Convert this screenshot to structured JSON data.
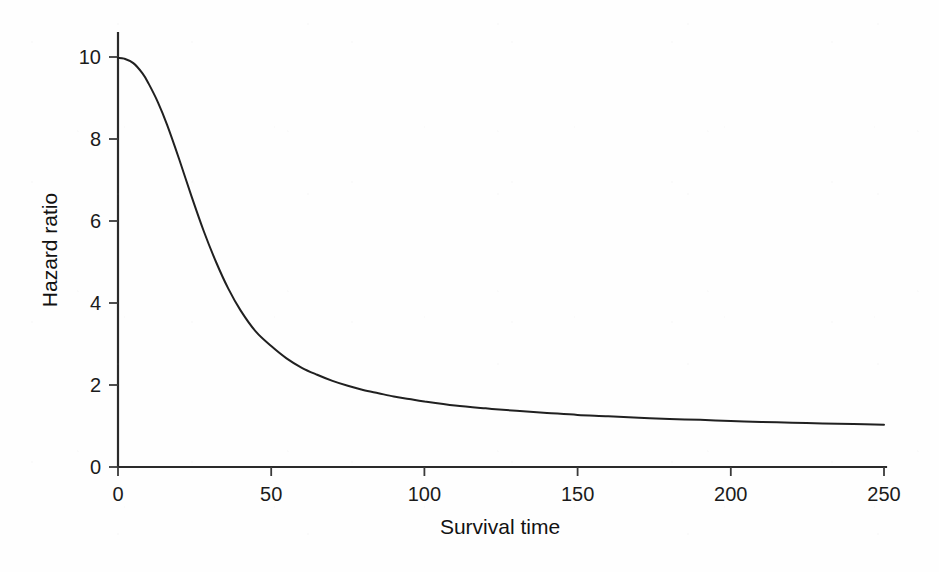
{
  "figure": {
    "background_color": "#fefefe",
    "ink_color": "#202020"
  },
  "chart_data": {
    "type": "line",
    "title": "",
    "subtitle": "",
    "xlabel": "Survival time",
    "ylabel": "Hazard ratio",
    "xlim": [
      0,
      250
    ],
    "ylim": [
      0,
      10
    ],
    "xticks": [
      0,
      50,
      100,
      150,
      200,
      250
    ],
    "yticks": [
      0,
      2,
      4,
      6,
      8,
      10
    ],
    "xtick_labels": [
      "0",
      "50",
      "100",
      "150",
      "200",
      "250"
    ],
    "ytick_labels": [
      "0",
      "2",
      "4",
      "6",
      "8",
      "10"
    ],
    "grid": false,
    "legend": false,
    "legend_position": "none",
    "annotations": [],
    "series": [
      {
        "name": "Hazard ratio",
        "color": "#202020",
        "line_width": 2.0,
        "x": [
          0,
          2,
          5,
          8,
          10,
          13,
          16,
          20,
          24,
          28,
          32,
          36,
          40,
          45,
          50,
          55,
          60,
          65,
          70,
          75,
          80,
          85,
          90,
          95,
          100,
          110,
          120,
          130,
          140,
          150,
          160,
          170,
          180,
          190,
          200,
          210,
          220,
          230,
          240,
          250
        ],
        "y": [
          9.98,
          9.96,
          9.85,
          9.6,
          9.35,
          8.9,
          8.35,
          7.5,
          6.6,
          5.75,
          5.0,
          4.35,
          3.82,
          3.3,
          2.95,
          2.65,
          2.42,
          2.25,
          2.1,
          1.98,
          1.88,
          1.8,
          1.72,
          1.66,
          1.6,
          1.5,
          1.43,
          1.37,
          1.32,
          1.27,
          1.24,
          1.2,
          1.17,
          1.15,
          1.12,
          1.1,
          1.08,
          1.06,
          1.05,
          1.03
        ]
      }
    ]
  },
  "axes": {
    "x_axis_name": "x-axis",
    "y_axis_name": "y-axis",
    "tick_direction": "outward"
  }
}
